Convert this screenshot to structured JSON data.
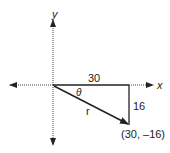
{
  "diagram": {
    "type": "vector-right-triangle",
    "axes": {
      "x_label": "x",
      "y_label": "y"
    },
    "labels": {
      "horizontal_leg": "30",
      "vertical_leg": "16",
      "hypotenuse": "r",
      "angle": "θ",
      "endpoint": "(30, –16)"
    },
    "colors": {
      "line": "#222222",
      "axis": "#333333",
      "background": "#ffffff"
    }
  }
}
